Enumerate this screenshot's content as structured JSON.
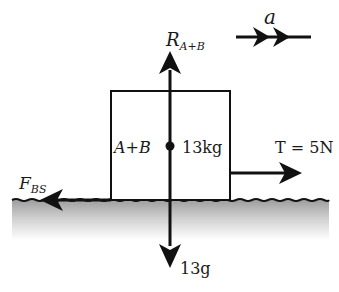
{
  "diagram": {
    "type": "free-body diagram",
    "body": {
      "name_label": "A+B",
      "mass_label": "13kg"
    },
    "forces": {
      "reaction": {
        "symbol": "R",
        "subscript": "A+B",
        "direction": "up"
      },
      "weight": {
        "label": "13g",
        "direction": "down"
      },
      "tension": {
        "label": "T = 5N",
        "symbol": "T",
        "value": "5N",
        "direction": "right"
      },
      "friction": {
        "symbol": "F",
        "subscript": "BS",
        "direction": "left"
      }
    },
    "acceleration": {
      "label": "a",
      "direction": "right"
    },
    "colors": {
      "ink": "#111111",
      "ground_shade": "#a6a6a6"
    }
  }
}
